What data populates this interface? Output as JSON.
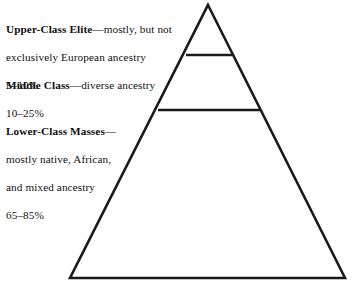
{
  "diagram": {
    "type": "social-class-pyramid",
    "background_color": "#ffffff",
    "stroke_color": "#1a1a1a",
    "stroke_width": 2.6,
    "apex": {
      "x": 208,
      "y": 5
    },
    "bottom_left": {
      "x": 70,
      "y": 278
    },
    "bottom_right": {
      "x": 345,
      "y": 278
    },
    "dividers": [
      {
        "name": "upper-middle-divider",
        "y": 55,
        "x1": 186,
        "x2": 232
      },
      {
        "name": "middle-lower-divider",
        "y": 110,
        "x1": 158,
        "x2": 260
      }
    ],
    "tiers": [
      {
        "id": "upper-class-elite",
        "term": "Upper-Class Elite",
        "dash": "—",
        "description": "mostly, but not exclusively European ancestry",
        "percentage": "5–10%",
        "lines": [
          "Upper-Class Elite—mostly, but not",
          "exclusively European ancestry",
          "5–10%"
        ]
      },
      {
        "id": "middle-class",
        "term": "Middle Class",
        "dash": "—",
        "description": "diverse ancestry",
        "percentage": "10–25%",
        "lines": [
          "Middle Class—diverse ancestry",
          "10–25%"
        ]
      },
      {
        "id": "lower-class-masses",
        "term": "Lower-Class Masses",
        "dash": "—",
        "description": "mostly native, African, and mixed ancestry",
        "percentage": "65–85%",
        "lines": [
          "Lower-Class Masses—",
          "mostly native, African,",
          "and mixed ancestry",
          "65–85%"
        ]
      }
    ]
  }
}
